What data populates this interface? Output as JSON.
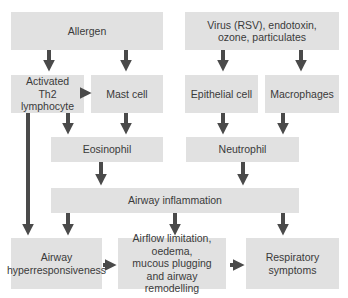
{
  "diagram": {
    "colors": {
      "box_fill": "#e1e1e1",
      "arrow": "#4a4a4a",
      "text": "#3a3a3a",
      "background": "#ffffff"
    },
    "nodes": {
      "allergen": "Allergen",
      "virus": "Virus (RSV), endotoxin,\nozone, particulates",
      "th2": "Activated\nTh2 lymphocyte",
      "mast_cell": "Mast cell",
      "epithelial_cell": "Epithelial cell",
      "macrophages": "Macrophages",
      "eosinophil": "Eosinophil",
      "neutrophil": "Neutrophil",
      "airway_inflammation": "Airway inflammation",
      "airway_hyperresponsiveness": "Airway\nhyperresponsiveness",
      "airflow_limitation": "Airflow limitation, oedema,\nmucous plugging\nand airway remodelling",
      "respiratory_symptoms": "Respiratory\nsymptoms"
    },
    "edges": [
      {
        "from": "Allergen",
        "to": "Activated Th2 lymphocyte"
      },
      {
        "from": "Allergen",
        "to": "Mast cell"
      },
      {
        "from": "Virus (RSV), endotoxin, ozone, particulates",
        "to": "Epithelial cell"
      },
      {
        "from": "Virus (RSV), endotoxin, ozone, particulates",
        "to": "Macrophages"
      },
      {
        "from": "Activated Th2 lymphocyte",
        "to": "Mast cell"
      },
      {
        "from": "Activated Th2 lymphocyte",
        "to": "Eosinophil"
      },
      {
        "from": "Activated Th2 lymphocyte",
        "to": "Airway hyperresponsiveness"
      },
      {
        "from": "Mast cell",
        "to": "Eosinophil"
      },
      {
        "from": "Epithelial cell",
        "to": "Neutrophil"
      },
      {
        "from": "Macrophages",
        "to": "Neutrophil"
      },
      {
        "from": "Eosinophil",
        "to": "Airway inflammation"
      },
      {
        "from": "Neutrophil",
        "to": "Airway inflammation"
      },
      {
        "from": "Airway inflammation",
        "to": "Airway hyperresponsiveness"
      },
      {
        "from": "Airway inflammation",
        "to": "Airflow limitation, oedema, mucous plugging and airway remodelling"
      },
      {
        "from": "Airway inflammation",
        "to": "Respiratory symptoms"
      },
      {
        "from": "Airway hyperresponsiveness",
        "to": "Airflow limitation, oedema, mucous plugging and airway remodelling"
      },
      {
        "from": "Airflow limitation, oedema, mucous plugging and airway remodelling",
        "to": "Respiratory symptoms"
      }
    ]
  }
}
